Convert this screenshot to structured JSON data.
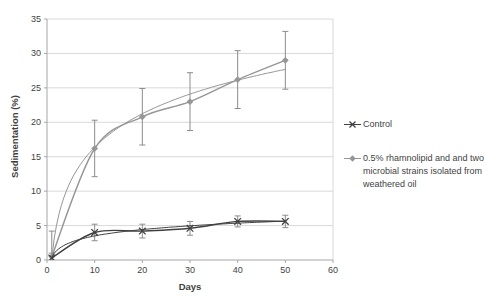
{
  "chart_data": {
    "type": "line",
    "title": "",
    "xlabel": "Days",
    "ylabel": "Sedimentation (%)",
    "xlim": [
      0,
      60
    ],
    "ylim": [
      0,
      35
    ],
    "xticks": [
      0,
      10,
      20,
      30,
      40,
      50,
      60
    ],
    "yticks": [
      0,
      5,
      10,
      15,
      20,
      25,
      30,
      35
    ],
    "grid": "horizontal",
    "legend_position": "right",
    "x": [
      1,
      10,
      20,
      30,
      40,
      50
    ],
    "series": [
      {
        "name": "Control",
        "marker": "x",
        "color": "#404040",
        "values": [
          0.3,
          4.0,
          4.2,
          4.6,
          5.6,
          5.6
        ],
        "error": [
          0.7,
          1.2,
          1.0,
          1.0,
          0.8,
          0.9
        ],
        "trendline": "logarithmic",
        "label_lines": [
          "Control"
        ]
      },
      {
        "name": "0.5% rhamnolipid and and two microbial strains isolated from weathered oil",
        "marker": "diamond",
        "color": "#969696",
        "values": [
          0.5,
          16.2,
          20.8,
          23.0,
          26.2,
          29.0
        ],
        "error": [
          3.7,
          4.1,
          4.1,
          4.2,
          4.2,
          4.2
        ],
        "trendline": "logarithmic",
        "label_lines": [
          "0.5% rhamnolipid and and two",
          "microbial strains isolated from",
          "weathered oil"
        ]
      }
    ],
    "colors": {
      "error_bar": "#8c8c8c",
      "gridline": "#d9d9d9",
      "axis_line": "#a6a6a6",
      "text": "#3f3f3f"
    }
  }
}
